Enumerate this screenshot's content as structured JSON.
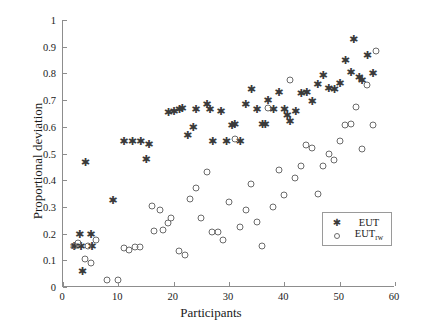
{
  "chart_data": {
    "type": "scatter",
    "title": "",
    "xlabel": "Participants",
    "ylabel": "Proportional deviation",
    "xlim": [
      0,
      60
    ],
    "ylim": [
      0,
      1
    ],
    "xticks": [
      0,
      10,
      20,
      30,
      40,
      50,
      60
    ],
    "yticks": [
      0,
      0.1,
      0.2,
      0.3,
      0.4,
      0.5,
      0.6,
      0.7,
      0.8,
      0.9,
      1
    ],
    "xticklabels": [
      "0",
      "10",
      "20",
      "30",
      "40",
      "50",
      "60"
    ],
    "yticklabels": [
      "0",
      "0.1",
      "0.2",
      "0.3",
      "0.4",
      "0.5",
      "0.6",
      "0.7",
      "0.8",
      "0.9",
      "1"
    ],
    "grid": false,
    "legend_position": "lower right",
    "series": [
      {
        "name": "EUT",
        "marker": "asterisk",
        "color": "#3a3a3a",
        "points": [
          [
            2,
            0.155
          ],
          [
            3,
            0.2
          ],
          [
            3.2,
            0.155
          ],
          [
            4,
            0.47
          ],
          [
            5,
            0.2
          ],
          [
            5.2,
            0.155
          ],
          [
            3.5,
            0.06
          ],
          [
            9,
            0.325
          ],
          [
            11,
            0.545
          ],
          [
            12.5,
            0.545
          ],
          [
            14,
            0.545
          ],
          [
            15,
            0.48
          ],
          [
            15.5,
            0.535
          ],
          [
            19,
            0.655
          ],
          [
            20,
            0.66
          ],
          [
            21,
            0.665
          ],
          [
            21.5,
            0.67
          ],
          [
            22.5,
            0.57
          ],
          [
            23.5,
            0.6
          ],
          [
            24,
            0.665
          ],
          [
            26,
            0.685
          ],
          [
            26.5,
            0.665
          ],
          [
            27,
            0.545
          ],
          [
            28.5,
            0.66
          ],
          [
            29.5,
            0.545
          ],
          [
            30.5,
            0.605
          ],
          [
            31,
            0.61
          ],
          [
            32,
            0.545
          ],
          [
            33,
            0.685
          ],
          [
            34,
            0.74
          ],
          [
            35,
            0.665
          ],
          [
            36,
            0.61
          ],
          [
            36.5,
            0.61
          ],
          [
            37,
            0.7
          ],
          [
            38,
            0.665
          ],
          [
            39,
            0.73
          ],
          [
            40,
            0.665
          ],
          [
            40.5,
            0.645
          ],
          [
            41,
            0.62
          ],
          [
            42,
            0.66
          ],
          [
            43,
            0.725
          ],
          [
            44,
            0.73
          ],
          [
            45,
            0.695
          ],
          [
            46,
            0.76
          ],
          [
            47,
            0.795
          ],
          [
            48,
            0.745
          ],
          [
            49,
            0.74
          ],
          [
            50,
            0.765
          ],
          [
            51,
            0.85
          ],
          [
            52,
            0.805
          ],
          [
            52.5,
            0.93
          ],
          [
            53.5,
            0.785
          ],
          [
            54,
            0.775
          ],
          [
            55,
            0.87
          ],
          [
            56,
            0.8
          ]
        ]
      },
      {
        "name": "EUT_rw",
        "marker": "circle",
        "color": "#6b6b6b",
        "points": [
          [
            2,
            0.155
          ],
          [
            2.8,
            0.165
          ],
          [
            4,
            0.105
          ],
          [
            4.5,
            0.155
          ],
          [
            5,
            0.09
          ],
          [
            6,
            0.175
          ],
          [
            8,
            0.025
          ],
          [
            10,
            0.025
          ],
          [
            11,
            0.145
          ],
          [
            12,
            0.14
          ],
          [
            13,
            0.15
          ],
          [
            14,
            0.15
          ],
          [
            16,
            0.305
          ],
          [
            16.5,
            0.21
          ],
          [
            17.5,
            0.29
          ],
          [
            18,
            0.215
          ],
          [
            19,
            0.24
          ],
          [
            19.5,
            0.26
          ],
          [
            21,
            0.135
          ],
          [
            22,
            0.12
          ],
          [
            23,
            0.33
          ],
          [
            24,
            0.37
          ],
          [
            25,
            0.26
          ],
          [
            26,
            0.43
          ],
          [
            27,
            0.205
          ],
          [
            28,
            0.205
          ],
          [
            29,
            0.175
          ],
          [
            30,
            0.32
          ],
          [
            31,
            0.555
          ],
          [
            32,
            0.225
          ],
          [
            33,
            0.29
          ],
          [
            34,
            0.385
          ],
          [
            35,
            0.245
          ],
          [
            36,
            0.155
          ],
          [
            37,
            0.67
          ],
          [
            38,
            0.3
          ],
          [
            39,
            0.44
          ],
          [
            40,
            0.345
          ],
          [
            41,
            0.775
          ],
          [
            42,
            0.41
          ],
          [
            43,
            0.455
          ],
          [
            44,
            0.53
          ],
          [
            45,
            0.52
          ],
          [
            46,
            0.35
          ],
          [
            47,
            0.455
          ],
          [
            48,
            0.5
          ],
          [
            49,
            0.475
          ],
          [
            50,
            0.545
          ],
          [
            51,
            0.605
          ],
          [
            52,
            0.61
          ],
          [
            53,
            0.675
          ],
          [
            54,
            0.515
          ],
          [
            55,
            0.755
          ],
          [
            56,
            0.605
          ],
          [
            56.5,
            0.885
          ]
        ]
      }
    ]
  },
  "legend": {
    "entries": [
      {
        "label": "EUT",
        "sub": "",
        "symbol": "asterisk-marker"
      },
      {
        "label": "EUT",
        "sub": "rw",
        "symbol": "circle-marker"
      }
    ]
  }
}
